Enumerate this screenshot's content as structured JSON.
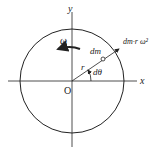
{
  "diagram": {
    "type": "rotating-disk-mass-element",
    "labels": {
      "y_axis": "y",
      "x_axis": "x",
      "origin": "O",
      "omega": "ω",
      "mass_element": "dm",
      "radius": "r",
      "angle": "dθ",
      "force": "dm·r ω²"
    },
    "colors": {
      "stroke": "#222222",
      "background": "#ffffff"
    }
  }
}
